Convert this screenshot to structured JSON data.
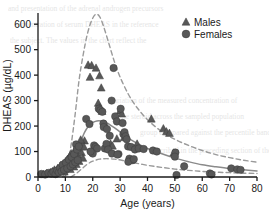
{
  "chart_data": {
    "type": "scatter",
    "title": "",
    "xlabel": "Age (years)",
    "ylabel": "DHEAS (µg/dL)",
    "xlim": [
      0,
      80
    ],
    "ylim": [
      0,
      640
    ],
    "xticks": [
      0,
      10,
      20,
      30,
      40,
      50,
      60,
      70,
      80
    ],
    "yticks": [
      0,
      100,
      200,
      300,
      400,
      500,
      600
    ],
    "xtick_labels": [
      "0",
      "10",
      "20",
      "30",
      "40",
      "50",
      "60",
      "70",
      "80"
    ],
    "ytick_labels": [
      "0",
      "100",
      "200",
      "300",
      "400",
      "500",
      "600"
    ],
    "grid": false,
    "legend_position": "top-right",
    "legend": [
      {
        "name": "Males",
        "marker": "triangle",
        "color": "#585858"
      },
      {
        "name": "Females",
        "marker": "circle",
        "color": "#585858"
      }
    ],
    "series": [
      {
        "name": "Males",
        "marker": "triangle",
        "color": "#585858",
        "points": [
          [
            2.0,
            10
          ],
          [
            3.2,
            14
          ],
          [
            4.5,
            18
          ],
          [
            5.3,
            22
          ],
          [
            6.0,
            28
          ],
          [
            6.6,
            16
          ],
          [
            7.2,
            34
          ],
          [
            7.8,
            24
          ],
          [
            8.3,
            44
          ],
          [
            8.8,
            30
          ],
          [
            9.2,
            52
          ],
          [
            9.6,
            20
          ],
          [
            10.0,
            60
          ],
          [
            10.4,
            38
          ],
          [
            10.8,
            70
          ],
          [
            11.1,
            46
          ],
          [
            11.5,
            80
          ],
          [
            11.8,
            30
          ],
          [
            12.1,
            92
          ],
          [
            12.4,
            56
          ],
          [
            12.8,
            66
          ],
          [
            13.1,
            40
          ],
          [
            13.4,
            104
          ],
          [
            13.7,
            76
          ],
          [
            14.0,
            50
          ],
          [
            14.3,
            118
          ],
          [
            14.6,
            86
          ],
          [
            15.0,
            62
          ],
          [
            15.4,
            130
          ],
          [
            15.9,
            96
          ],
          [
            16.4,
            74
          ],
          [
            17.0,
            142
          ],
          [
            18.3,
            440
          ],
          [
            19.6,
            438
          ],
          [
            19.0,
            392
          ],
          [
            21.2,
            428
          ],
          [
            22.5,
            398
          ],
          [
            23.1,
            350
          ],
          [
            22.0,
            290
          ],
          [
            22.6,
            272
          ],
          [
            23.4,
            258
          ],
          [
            24.6,
            205
          ],
          [
            30.0,
            260
          ],
          [
            30.6,
            248
          ],
          [
            31.4,
            155
          ],
          [
            28.8,
            150
          ],
          [
            41.4,
            228
          ],
          [
            45.8,
            190
          ],
          [
            46.9,
            178
          ],
          [
            48.0,
            172
          ],
          [
            49.6,
            95
          ],
          [
            36.2,
            130
          ],
          [
            26.5,
            130
          ],
          [
            27.2,
            122
          ],
          [
            15.6,
            146
          ],
          [
            16.8,
            118
          ]
        ]
      },
      {
        "name": "Females",
        "marker": "circle",
        "color": "#585858",
        "points": [
          [
            1.2,
            12
          ],
          [
            2.6,
            10
          ],
          [
            3.8,
            16
          ],
          [
            4.9,
            13
          ],
          [
            5.6,
            20
          ],
          [
            6.4,
            11
          ],
          [
            7.0,
            26
          ],
          [
            7.6,
            18
          ],
          [
            8.1,
            36
          ],
          [
            8.6,
            22
          ],
          [
            9.0,
            48
          ],
          [
            9.5,
            28
          ],
          [
            10.2,
            56
          ],
          [
            10.7,
            34
          ],
          [
            11.3,
            68
          ],
          [
            11.9,
            42
          ],
          [
            12.3,
            78
          ],
          [
            12.7,
            50
          ],
          [
            13.2,
            90
          ],
          [
            13.6,
            58
          ],
          [
            13.9,
            128
          ],
          [
            14.2,
            108
          ],
          [
            14.5,
            66
          ],
          [
            14.9,
            120
          ],
          [
            17.6,
            228
          ],
          [
            18.8,
            208
          ],
          [
            19.8,
            96
          ],
          [
            20.5,
            124
          ],
          [
            21.0,
            118
          ],
          [
            21.6,
            112
          ],
          [
            22.2,
            268
          ],
          [
            22.8,
            262
          ],
          [
            23.5,
            256
          ],
          [
            23.9,
            210
          ],
          [
            24.4,
            112
          ],
          [
            25.0,
            130
          ],
          [
            25.6,
            108
          ],
          [
            26.2,
            162
          ],
          [
            26.9,
            300
          ],
          [
            27.6,
            428
          ],
          [
            28.2,
            238
          ],
          [
            28.8,
            218
          ],
          [
            29.4,
            90
          ],
          [
            30.2,
            268
          ],
          [
            30.9,
            212
          ],
          [
            31.2,
            168
          ],
          [
            31.6,
            176
          ],
          [
            32.0,
            160
          ],
          [
            32.4,
            148
          ],
          [
            32.9,
            120
          ],
          [
            33.4,
            72
          ],
          [
            34.0,
            118
          ],
          [
            34.6,
            66
          ],
          [
            35.4,
            108
          ],
          [
            36.8,
            112
          ],
          [
            38.6,
            110
          ],
          [
            42.0,
            104
          ],
          [
            43.4,
            100
          ],
          [
            50.2,
            96
          ],
          [
            50.6,
            8
          ],
          [
            50.0,
            80
          ],
          [
            53.4,
            42
          ],
          [
            62.8,
            14
          ],
          [
            63.4,
            10
          ],
          [
            70.6,
            34
          ],
          [
            72.8,
            30
          ],
          [
            74.0,
            28
          ],
          [
            27.0,
            92
          ],
          [
            29.0,
            88
          ],
          [
            20.0,
            92
          ],
          [
            19.2,
            100
          ],
          [
            24.0,
            196
          ],
          [
            25.2,
            188
          ],
          [
            33.0,
            60
          ],
          [
            35.0,
            70
          ]
        ]
      }
    ],
    "curves": [
      {
        "name": "upper-reference",
        "style": "dashed",
        "color": "#9a9a9a",
        "points": [
          [
            9.0,
            0
          ],
          [
            10.5,
            40
          ],
          [
            12.0,
            120
          ],
          [
            13.5,
            240
          ],
          [
            15.0,
            380
          ],
          [
            16.5,
            480
          ],
          [
            18.0,
            560
          ],
          [
            19.5,
            612
          ],
          [
            21.0,
            638
          ],
          [
            22.5,
            630
          ],
          [
            24.0,
            590
          ],
          [
            26.0,
            520
          ],
          [
            28.0,
            450
          ],
          [
            30.0,
            392
          ],
          [
            33.0,
            325
          ],
          [
            36.0,
            275
          ],
          [
            40.0,
            225
          ],
          [
            45.0,
            180
          ],
          [
            50.0,
            148
          ],
          [
            55.0,
            124
          ],
          [
            60.0,
            104
          ],
          [
            65.0,
            88
          ],
          [
            70.0,
            76
          ],
          [
            75.0,
            66
          ],
          [
            80.0,
            58
          ]
        ]
      },
      {
        "name": "median-curve",
        "style": "solid",
        "color": "#8a8a8a",
        "points": [
          [
            9.5,
            0
          ],
          [
            11.0,
            18
          ],
          [
            12.5,
            48
          ],
          [
            14.0,
            90
          ],
          [
            15.5,
            135
          ],
          [
            17.0,
            175
          ],
          [
            18.5,
            200
          ],
          [
            20.0,
            214
          ],
          [
            21.5,
            220
          ],
          [
            23.0,
            220
          ],
          [
            25.0,
            213
          ],
          [
            27.0,
            200
          ],
          [
            29.0,
            185
          ],
          [
            31.0,
            168
          ],
          [
            34.0,
            146
          ],
          [
            37.0,
            128
          ],
          [
            40.0,
            112
          ],
          [
            45.0,
            92
          ],
          [
            50.0,
            74
          ],
          [
            55.0,
            60
          ],
          [
            60.0,
            48
          ],
          [
            65.0,
            40
          ],
          [
            70.0,
            33
          ],
          [
            75.0,
            28
          ],
          [
            80.0,
            24
          ]
        ]
      },
      {
        "name": "lower-reference",
        "style": "dashed",
        "color": "#9a9a9a",
        "points": [
          [
            12.0,
            0
          ],
          [
            14.0,
            14
          ],
          [
            16.0,
            32
          ],
          [
            18.0,
            50
          ],
          [
            20.0,
            62
          ],
          [
            22.5,
            70
          ],
          [
            25.0,
            72
          ],
          [
            28.0,
            70
          ],
          [
            31.0,
            65
          ],
          [
            35.0,
            56
          ],
          [
            40.0,
            46
          ],
          [
            45.0,
            38
          ],
          [
            50.0,
            31
          ],
          [
            55.0,
            26
          ],
          [
            60.0,
            22
          ],
          [
            65.0,
            19
          ],
          [
            70.0,
            17
          ],
          [
            75.0,
            15
          ],
          [
            80.0,
            14
          ]
        ]
      }
    ]
  },
  "axes": {
    "x_title": "Age (years)",
    "y_title": "DHEAS (µg/dL)"
  },
  "legend": {
    "males_label": "Males",
    "females_label": "Females"
  },
  "colors": {
    "marker": "#585858",
    "solid_curve": "#8a8a8a",
    "dashed_curve": "#9a9a9a",
    "axis": "#1a1a1a",
    "text": "#1a1a1a",
    "background": "#ffffff"
  },
  "background_text": {
    "lines": [
      "and presentation of the adrenal androgen precursors",
      "concentration of serum DHEAS in the reference",
      "the subject. The values in the chart reflect the",
      "variation of the measured concentration of",
      "the steroid across the sampled population",
      "group compared against the percentile bands",
      "described in the preceding section of the text."
    ]
  }
}
